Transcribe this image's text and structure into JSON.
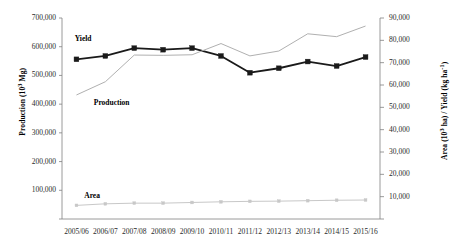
{
  "chart_data": {
    "type": "line",
    "title": "",
    "categories": [
      "2005/06",
      "2006/07",
      "2007/08",
      "2008/09",
      "2009/10",
      "2010/11",
      "2011/12",
      "2012/13",
      "2013/14",
      "2014/15",
      "2015/16"
    ],
    "xlabel": "",
    "axes": {
      "left": {
        "label": "Production (10³ Mg)",
        "ticks": [
          "100,000",
          "200,000",
          "300,000",
          "400,000",
          "500,000",
          "600,000",
          "700,000"
        ],
        "tick_values": [
          100000,
          200000,
          300000,
          400000,
          500000,
          600000,
          700000
        ],
        "ylim": [
          0,
          700000
        ],
        "grid": false
      },
      "right": {
        "label": "Area (10³ ha) / Yield (kg ha⁻¹)",
        "ticks": [
          "10,000",
          "20,000",
          "30,000",
          "40,000",
          "50,000",
          "60,000",
          "70,000",
          "80,000",
          "90,000"
        ],
        "tick_values": [
          10000,
          20000,
          30000,
          40000,
          50000,
          60000,
          70000,
          80000,
          90000
        ],
        "ylim": [
          0,
          90000
        ],
        "grid": false
      }
    },
    "legend_position": "inline-annotations",
    "series": [
      {
        "name": "Yield",
        "axis": "right",
        "unit": "kg ha⁻¹",
        "color": "#1a1a1a",
        "marker": "square",
        "values": [
          71500,
          73000,
          76500,
          75800,
          76500,
          73000,
          65500,
          67500,
          70500,
          68500,
          72500
        ]
      },
      {
        "name": "Production",
        "axis": "left",
        "unit": "10³ Mg",
        "color": "#b0b0b0",
        "marker": "none",
        "values": [
          432000,
          478000,
          571000,
          570000,
          572000,
          611000,
          568000,
          585000,
          645000,
          635000,
          672000
        ]
      },
      {
        "name": "Area",
        "axis": "right",
        "unit": "10³ ha",
        "color": "#c8c8c8",
        "marker": "small-square",
        "values": [
          6100,
          6800,
          7100,
          7100,
          7400,
          7700,
          7900,
          8000,
          8200,
          8400,
          8500
        ]
      }
    ],
    "annotations": [
      {
        "text": "Yield",
        "x": 0.04,
        "y": 0.08
      },
      {
        "text": "Production",
        "x": 0.1,
        "y": 0.4
      },
      {
        "text": "Area",
        "x": 0.07,
        "y": 0.86
      }
    ]
  }
}
